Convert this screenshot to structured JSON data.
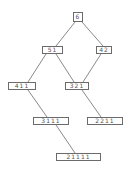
{
  "diagram": {
    "type": "hasse-diagram",
    "colors": {
      "line": "#6b6b6b",
      "box_border": "#6b6b6b",
      "text": "#555555",
      "background": "#ffffff"
    },
    "nodes": [
      {
        "id": "6",
        "label": "6",
        "x": 73,
        "y": 12,
        "w": 10,
        "h": 10
      },
      {
        "id": "51",
        "label": "51",
        "x": 42,
        "y": 46,
        "w": 21,
        "h": 8
      },
      {
        "id": "42",
        "label": "42",
        "x": 96,
        "y": 46,
        "w": 16,
        "h": 8
      },
      {
        "id": "411",
        "label": "411",
        "x": 8,
        "y": 82,
        "w": 28,
        "h": 8
      },
      {
        "id": "321",
        "label": "321",
        "x": 65,
        "y": 82,
        "w": 24,
        "h": 8
      },
      {
        "id": "3111",
        "label": "3111",
        "x": 33,
        "y": 117,
        "w": 36,
        "h": 8
      },
      {
        "id": "2211",
        "label": "2211",
        "x": 87,
        "y": 117,
        "w": 36,
        "h": 8
      },
      {
        "id": "21111",
        "label": "21111",
        "x": 56,
        "y": 153,
        "w": 45,
        "h": 8
      }
    ],
    "edges": [
      {
        "from": "6",
        "to": "51",
        "x1": 75,
        "y1": 22,
        "x2": 56,
        "y2": 46
      },
      {
        "from": "6",
        "to": "42",
        "x1": 82,
        "y1": 22,
        "x2": 103,
        "y2": 46
      },
      {
        "from": "51",
        "to": "411",
        "x1": 46,
        "y1": 54,
        "x2": 28,
        "y2": 82
      },
      {
        "from": "51",
        "to": "321",
        "x1": 56,
        "y1": 54,
        "x2": 74,
        "y2": 82
      },
      {
        "from": "42",
        "to": "321",
        "x1": 101,
        "y1": 54,
        "x2": 83,
        "y2": 82
      },
      {
        "from": "411",
        "to": "3111",
        "x1": 28,
        "y1": 90,
        "x2": 47,
        "y2": 117
      },
      {
        "from": "321",
        "to": "2211",
        "x1": 82,
        "y1": 90,
        "x2": 101,
        "y2": 117
      },
      {
        "from": "3111",
        "to": "21111",
        "x1": 56,
        "y1": 125,
        "x2": 75,
        "y2": 153
      }
    ]
  }
}
